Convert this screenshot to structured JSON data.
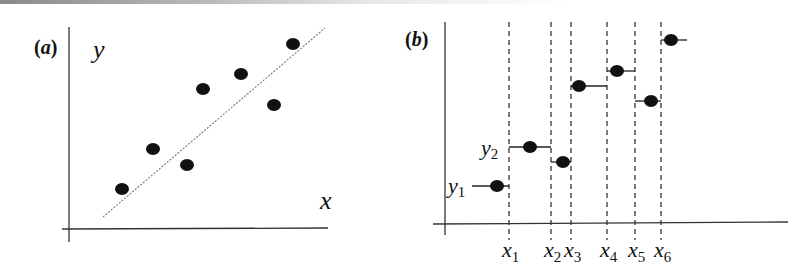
{
  "panels": {
    "a": {
      "label": "(a)",
      "label_letter": "a",
      "y_axis_label": "y",
      "x_axis_label": "x",
      "description": "scatter plot with fitted dashed regression line",
      "points": [
        {
          "x": 122,
          "y": 189
        },
        {
          "x": 153,
          "y": 149
        },
        {
          "x": 187,
          "y": 165
        },
        {
          "x": 203,
          "y": 89
        },
        {
          "x": 241,
          "y": 74
        },
        {
          "x": 274,
          "y": 105
        },
        {
          "x": 293,
          "y": 44
        }
      ],
      "fit_line": {
        "x1": 103,
        "y1": 217,
        "x2": 325,
        "y2": 28
      }
    },
    "b": {
      "label": "(b)",
      "label_letter": "b",
      "description": "piecewise-constant step function through data points with dashed x-breakpoints",
      "y_labels": [
        {
          "base": "y",
          "sub": "1"
        },
        {
          "base": "y",
          "sub": "2"
        }
      ],
      "x_labels": [
        {
          "base": "x",
          "sub": "1"
        },
        {
          "base": "x",
          "sub": "2"
        },
        {
          "base": "x",
          "sub": "3"
        },
        {
          "base": "x",
          "sub": "4"
        },
        {
          "base": "x",
          "sub": "5"
        },
        {
          "base": "x",
          "sub": "6"
        }
      ],
      "breakpoints_px": [
        509,
        551,
        571,
        607,
        635,
        661
      ],
      "steps": [
        {
          "x_start": 472,
          "x_end": 509,
          "y": 186,
          "dot_x": 497
        },
        {
          "x_start": 509,
          "x_end": 551,
          "y": 147,
          "dot_x": 530
        },
        {
          "x_start": 551,
          "x_end": 571,
          "y": 162,
          "dot_x": 563
        },
        {
          "x_start": 571,
          "x_end": 607,
          "y": 86,
          "dot_x": 579
        },
        {
          "x_start": 607,
          "x_end": 635,
          "y": 71,
          "dot_x": 617
        },
        {
          "x_start": 635,
          "x_end": 661,
          "y": 101,
          "dot_x": 651
        },
        {
          "x_start": 661,
          "x_end": 687,
          "y": 40,
          "dot_x": 671
        }
      ]
    }
  },
  "colors": {
    "ink": "#111111",
    "axis": "#333333",
    "fit_line": "#777777"
  }
}
